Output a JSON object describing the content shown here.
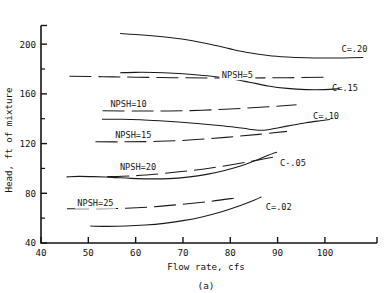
{
  "chart_data": {
    "type": "line",
    "title": "",
    "caption": "(a)",
    "xlabel": "Flow rate, cfs",
    "ylabel": "Head, ft of mixture",
    "xlim": [
      40,
      111
    ],
    "ylim": [
      40,
      215
    ],
    "xticks": [
      40,
      50,
      60,
      70,
      80,
      90,
      100
    ],
    "xticklabels": [
      "40",
      "50",
      "60",
      "70",
      "80",
      "90",
      "100"
    ],
    "yticks": [
      40,
      80,
      120,
      160,
      200
    ],
    "yticklabels": [
      "40",
      "80",
      "120",
      "160",
      "200"
    ],
    "grid": false,
    "legend": "inline-labels",
    "series": [
      {
        "name": "C=.20",
        "label": "C=.20",
        "style": "solid",
        "label_x": 103.5,
        "label_y": 196,
        "points": [
          [
            56.8,
            208.5
          ],
          [
            60,
            207.8
          ],
          [
            64,
            206.6
          ],
          [
            68,
            205.0
          ],
          [
            72,
            202.8
          ],
          [
            76,
            199.8
          ],
          [
            80,
            196.2
          ],
          [
            84,
            193.0
          ],
          [
            88,
            190.8
          ],
          [
            92,
            189.6
          ],
          [
            96,
            189.0
          ],
          [
            100,
            188.8
          ],
          [
            104,
            188.9
          ],
          [
            108,
            189.2
          ]
        ]
      },
      {
        "name": "C=.15",
        "label": "C=.15",
        "style": "solid",
        "label_x": 101.5,
        "label_y": 165,
        "points": [
          [
            56.8,
            177.0
          ],
          [
            60,
            177.3
          ],
          [
            64,
            177.2
          ],
          [
            68,
            176.6
          ],
          [
            72,
            175.6
          ],
          [
            76,
            174.2
          ],
          [
            80,
            172.2
          ],
          [
            84,
            169.4
          ],
          [
            88,
            166.4
          ],
          [
            92,
            164.4
          ],
          [
            96,
            163.4
          ],
          [
            100,
            163.4
          ],
          [
            103,
            164.2
          ]
        ]
      },
      {
        "name": "C=.10",
        "label": "C=.10",
        "style": "solid",
        "label_x": 97.5,
        "label_y": 142,
        "points": [
          [
            53.0,
            139.6
          ],
          [
            57,
            139.6
          ],
          [
            61,
            139.2
          ],
          [
            65,
            138.4
          ],
          [
            69,
            137.4
          ],
          [
            73,
            136.2
          ],
          [
            77,
            134.8
          ],
          [
            81,
            133.2
          ],
          [
            84,
            131.6
          ],
          [
            86,
            130.8
          ],
          [
            88,
            131.2
          ],
          [
            90,
            132.6
          ],
          [
            93,
            134.8
          ],
          [
            96,
            136.8
          ],
          [
            99,
            138.4
          ],
          [
            101,
            139.4
          ]
        ]
      },
      {
        "name": "C-.05",
        "label": "C-.05",
        "style": "solid",
        "label_x": 90.5,
        "label_y": 104,
        "points": [
          [
            45.5,
            93.2
          ],
          [
            48,
            93.6
          ],
          [
            51,
            93.4
          ],
          [
            55,
            92.8
          ],
          [
            59,
            92.0
          ],
          [
            63,
            91.6
          ],
          [
            67,
            91.8
          ],
          [
            71,
            93.0
          ],
          [
            75,
            95.2
          ],
          [
            79,
            98.6
          ],
          [
            83,
            103.0
          ],
          [
            86,
            107.4
          ],
          [
            88,
            110.6
          ],
          [
            89.8,
            113.0
          ]
        ]
      },
      {
        "name": "C=.02",
        "label": "C=.02",
        "style": "solid",
        "label_x": 87.5,
        "label_y": 69,
        "points": [
          [
            50.5,
            53.6
          ],
          [
            54,
            53.4
          ],
          [
            58,
            53.6
          ],
          [
            62,
            54.4
          ],
          [
            66,
            55.8
          ],
          [
            70,
            58.0
          ],
          [
            74,
            61.0
          ],
          [
            78,
            65.0
          ],
          [
            82,
            70.0
          ],
          [
            85,
            74.4
          ],
          [
            86.5,
            77.0
          ]
        ]
      }
    ],
    "npsh_lines": [
      {
        "name": "NPSH=5",
        "label": "NPSH=5",
        "style": "dashed",
        "label_x": 81.5,
        "label_y": 175.5,
        "points": [
          [
            46.0,
            174.2
          ],
          [
            53.0,
            173.8
          ],
          [
            60.0,
            173.4
          ],
          [
            68.0,
            173.0
          ],
          [
            76.0,
            172.8
          ],
          [
            84.0,
            172.8
          ],
          [
            92.0,
            173.0
          ],
          [
            100.0,
            173.4
          ]
        ]
      },
      {
        "name": "NPSH=10",
        "label": "NPSH=10",
        "style": "dashed",
        "label_x": 58.5,
        "label_y": 152,
        "points": [
          [
            53.0,
            146.4
          ],
          [
            60.0,
            146.2
          ],
          [
            67.0,
            146.2
          ],
          [
            74.0,
            146.8
          ],
          [
            81.0,
            148.0
          ],
          [
            88.0,
            149.6
          ],
          [
            94.0,
            151.2
          ]
        ]
      },
      {
        "name": "NPSH=15",
        "label": "NPSH=15",
        "style": "dashed",
        "label_x": 59.5,
        "label_y": 126.5,
        "points": [
          [
            51.5,
            121.4
          ],
          [
            58.0,
            121.4
          ],
          [
            65.0,
            121.8
          ],
          [
            72.0,
            123.0
          ],
          [
            79.0,
            125.0
          ],
          [
            86.0,
            127.4
          ],
          [
            92.0,
            129.8
          ]
        ]
      },
      {
        "name": "NPSH=20",
        "label": "NPSH=20",
        "style": "dashed",
        "label_x": 60.5,
        "label_y": 101.5,
        "points": [
          [
            54.0,
            93.4
          ],
          [
            60.0,
            94.2
          ],
          [
            66.0,
            96.0
          ],
          [
            72.0,
            98.4
          ],
          [
            78.0,
            101.6
          ],
          [
            84.0,
            105.4
          ],
          [
            89.0,
            109.0
          ]
        ]
      },
      {
        "name": "NPSH=25",
        "label": "NPSH=25",
        "style": "dashed",
        "label_x": 51.5,
        "label_y": 72,
        "points": [
          [
            45.5,
            67.6
          ],
          [
            52.0,
            67.6
          ],
          [
            58.0,
            68.0
          ],
          [
            64.0,
            69.2
          ],
          [
            70.0,
            71.2
          ],
          [
            76.0,
            73.6
          ],
          [
            81.0,
            76.2
          ]
        ]
      }
    ]
  }
}
